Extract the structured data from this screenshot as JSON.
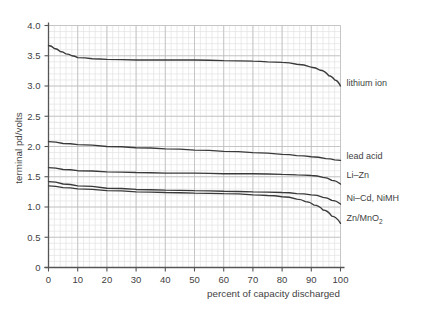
{
  "figure": {
    "ghost_header": "p  g",
    "background_color": "#ffffff",
    "grid_minor_color": "#e3e3e3",
    "grid_major_color": "#bdbdbd",
    "axis_color": "#555555",
    "curve_color": "#3a3a3a",
    "text_color": "#3f3f3f"
  },
  "chart_data": {
    "type": "line",
    "title": "",
    "xlabel": "percent of capacity discharged",
    "ylabel": "terminal pd/volts",
    "xlim": [
      0,
      100
    ],
    "ylim": [
      0,
      4.0
    ],
    "xticks": [
      0,
      10,
      20,
      30,
      40,
      50,
      60,
      70,
      80,
      90,
      100
    ],
    "xtick_labels": [
      "0",
      "10",
      "20",
      "30",
      "40",
      "50",
      "60",
      "70",
      "80",
      "90",
      "100"
    ],
    "yticks": [
      0,
      0.5,
      1.0,
      1.5,
      2.0,
      2.5,
      3.0,
      3.5,
      4.0
    ],
    "ytick_labels": [
      "0",
      "0.5",
      "1.0",
      "1.5",
      "2.0",
      "2.5",
      "3.0",
      "3.5",
      "4.0"
    ],
    "grid": true,
    "grid_minor_x_step": 2,
    "grid_minor_y_step": 0.1,
    "grid_major_x_step": 10,
    "grid_major_y_step": 0.5,
    "legend_position": "right-inline-labels",
    "series": [
      {
        "name": "lithium ion",
        "label": "lithium ion",
        "label_x": 100,
        "label_y": 3.05,
        "x": [
          0,
          2,
          4,
          6,
          8,
          10,
          15,
          20,
          30,
          40,
          50,
          60,
          70,
          75,
          80,
          85,
          90,
          93,
          96,
          98,
          100
        ],
        "y": [
          3.67,
          3.62,
          3.57,
          3.53,
          3.5,
          3.47,
          3.45,
          3.44,
          3.43,
          3.43,
          3.43,
          3.42,
          3.41,
          3.4,
          3.39,
          3.36,
          3.31,
          3.26,
          3.17,
          3.1,
          3.0
        ]
      },
      {
        "name": "lead acid",
        "label": "lead acid",
        "label_x": 100,
        "label_y": 1.85,
        "x": [
          0,
          5,
          10,
          20,
          30,
          40,
          50,
          60,
          70,
          80,
          85,
          90,
          95,
          98,
          100
        ],
        "y": [
          2.08,
          2.05,
          2.03,
          2.0,
          1.98,
          1.96,
          1.94,
          1.92,
          1.9,
          1.87,
          1.85,
          1.83,
          1.8,
          1.78,
          1.77
        ]
      },
      {
        "name": "Li-Zn",
        "label": "Li–Zn",
        "label_x": 100,
        "label_y": 1.53,
        "x": [
          0,
          5,
          10,
          20,
          30,
          40,
          50,
          60,
          70,
          80,
          85,
          90,
          94,
          97,
          100
        ],
        "y": [
          1.65,
          1.62,
          1.6,
          1.58,
          1.57,
          1.56,
          1.56,
          1.55,
          1.55,
          1.54,
          1.53,
          1.52,
          1.49,
          1.44,
          1.38
        ]
      },
      {
        "name": "Ni-Cd, NiMH",
        "label": "Ni–Cd, NiMH",
        "label_x": 100,
        "label_y": 1.15,
        "x": [
          0,
          5,
          10,
          20,
          30,
          40,
          50,
          60,
          70,
          80,
          85,
          90,
          94,
          97,
          100
        ],
        "y": [
          1.42,
          1.38,
          1.35,
          1.31,
          1.29,
          1.28,
          1.27,
          1.26,
          1.25,
          1.24,
          1.22,
          1.2,
          1.16,
          1.11,
          1.05
        ]
      },
      {
        "name": "Zn/MnO2",
        "label": "Zn/MnO",
        "label_sub": "2",
        "label_x": 100,
        "label_y": 0.82,
        "x": [
          0,
          5,
          10,
          20,
          30,
          40,
          50,
          60,
          70,
          75,
          80,
          85,
          88,
          91,
          94,
          97,
          100
        ],
        "y": [
          1.35,
          1.32,
          1.3,
          1.27,
          1.25,
          1.24,
          1.23,
          1.22,
          1.2,
          1.19,
          1.17,
          1.13,
          1.09,
          1.03,
          0.95,
          0.85,
          0.73
        ]
      }
    ]
  }
}
